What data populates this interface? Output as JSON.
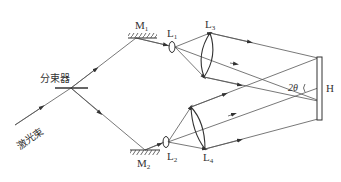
{
  "diagram": {
    "type": "holographic-recording-optical-setup",
    "labels": {
      "beam_splitter": "分束器",
      "laser_beam": "激光束",
      "mirror_1": "M",
      "mirror_1_sub": "1",
      "mirror_2": "M",
      "mirror_2_sub": "2",
      "lens_1": "L",
      "lens_1_sub": "1",
      "lens_2": "L",
      "lens_2_sub": "2",
      "lens_3": "L",
      "lens_3_sub": "3",
      "lens_4": "L",
      "lens_4_sub": "4",
      "hologram_plate": "H",
      "angle": "2θ"
    },
    "colors": {
      "line": "#444444",
      "background": "#ffffff"
    }
  }
}
